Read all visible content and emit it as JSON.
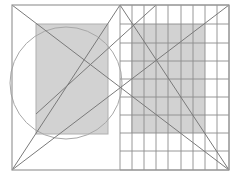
{
  "diagram": {
    "title": "",
    "colors": {
      "background": "#ffffff",
      "frame_stroke": "#9a9a9a",
      "grid_stroke": "#8c8c8c",
      "fill_gray": "#d2d2d2",
      "line_stroke": "#7a7a7a",
      "circle_stroke": "#a8a8a8"
    },
    "frame": {
      "x": 12,
      "y": 5,
      "width": 217,
      "height": 165
    },
    "left_rect": {
      "x": 36,
      "y": 24,
      "width": 72,
      "height": 110
    },
    "right_rect": {
      "x": 131,
      "y": 24,
      "width": 74,
      "height": 109
    },
    "circle": {
      "cx": 66,
      "cy": 83,
      "r": 56
    },
    "grid": {
      "columns_x": [
        120,
        132,
        144,
        156,
        168,
        181,
        193,
        205,
        217,
        229
      ],
      "rows_y": [
        5,
        24,
        43,
        61,
        79,
        97,
        115,
        133,
        151,
        170
      ]
    },
    "lines": [
      {
        "name": "diagonal-tl-br",
        "x1": 12,
        "y1": 5,
        "x2": 229,
        "y2": 170
      },
      {
        "name": "diagonal-bl-tr",
        "x1": 12,
        "y1": 170,
        "x2": 229,
        "y2": 5
      },
      {
        "name": "apex-to-bottom-left",
        "x1": 120,
        "y1": 5,
        "x2": 12,
        "y2": 170
      },
      {
        "name": "apex-to-bottom-right",
        "x1": 120,
        "y1": 5,
        "x2": 229,
        "y2": 170
      },
      {
        "name": "upper-chord",
        "x1": 156,
        "y1": 5,
        "x2": 36,
        "y2": 114
      }
    ]
  }
}
